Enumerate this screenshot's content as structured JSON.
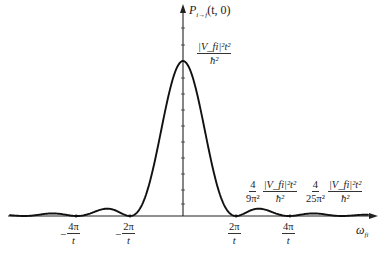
{
  "figure": {
    "y_axis_label": "P",
    "y_axis_label_sub": "i→f",
    "y_axis_label_args": "(t, 0)",
    "x_axis_label": "ω",
    "x_axis_label_sub": "fi",
    "peak_label": {
      "num": "|V_fi|²t²",
      "den": "ħ²"
    },
    "first_side_label": {
      "coef_num": "4",
      "coef_den": "9π²",
      "num": "|V_fi|²t²",
      "den": "ħ²"
    },
    "second_side_label": {
      "coef_num": "4",
      "coef_den": "25π²",
      "num": "|V_fi|²t²",
      "den": "ħ²"
    },
    "x_ticks": [
      {
        "num": "4π",
        "den": "t",
        "sign": "−"
      },
      {
        "num": "2π",
        "den": "t",
        "sign": "−"
      },
      {
        "num": "2π",
        "den": "t",
        "sign": ""
      },
      {
        "num": "4π",
        "den": "t",
        "sign": ""
      }
    ]
  },
  "chart_data": {
    "type": "line",
    "title": "",
    "xlabel": "ω_fi",
    "ylabel": "P_{i→f}(t,0)",
    "function": "sinc² shaped transition probability: P = |V_fi|² t²/ħ² · [sin(ω t/2)/(ω t/2)]²",
    "x_ticks": [
      "-4π/t",
      "-2π/t",
      "2π/t",
      "4π/t"
    ],
    "peak": {
      "x": 0,
      "value": "|V_fi|²t²/ħ²"
    },
    "side_maxima": [
      {
        "approx_x": "3π/t",
        "value": "4/(9π²)·|V_fi|²t²/ħ²"
      },
      {
        "approx_x": "5π/t",
        "value": "4/(25π²)·|V_fi|²t²/ħ²"
      }
    ],
    "zeros": [
      "-4π/t",
      "-2π/t",
      "2π/t",
      "4π/t"
    ],
    "grid": false
  }
}
